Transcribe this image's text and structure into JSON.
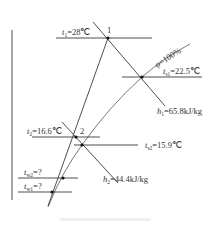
{
  "diagram": {
    "type": "psychrometric-process",
    "points": {
      "p1": {
        "label": "1"
      },
      "p2": {
        "label": "2"
      }
    },
    "labels": {
      "t1": {
        "var": "t",
        "sub": "1",
        "value": "=28℃"
      },
      "phi": {
        "var": "φ",
        "value": "=100%"
      },
      "ts1": {
        "var": "t",
        "sub": "s1",
        "value": "=22.5℃"
      },
      "h1": {
        "var": "h",
        "sub": "1",
        "value": "=65.8kJ/kg"
      },
      "t2": {
        "var": "t",
        "sub": "2",
        "value": "=16.6℃"
      },
      "ts2": {
        "var": "t",
        "sub": "s2",
        "value": "=15.9℃"
      },
      "h2": {
        "var": "h",
        "sub": "2",
        "value": "=44.4kJ/kg"
      },
      "tw2": {
        "var": "t",
        "sub": "w2",
        "value": "=?"
      },
      "tw1": {
        "var": "t",
        "sub": "w1",
        "value": "=?"
      }
    },
    "colors": {
      "line": "#3a3a3a",
      "curve": "#6a6a6a",
      "point": "#111111",
      "text": "#333333"
    }
  }
}
